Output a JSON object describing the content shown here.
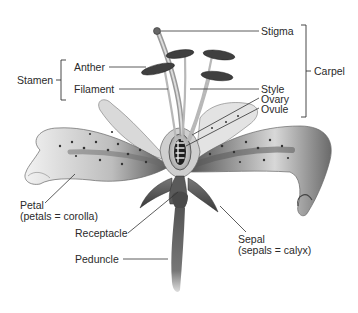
{
  "diagram": {
    "labels": {
      "stigma": "Stigma",
      "carpel": "Carpel",
      "stamen": "Stamen",
      "anther": "Anther",
      "filament": "Filament",
      "style": "Style",
      "ovary": "Ovary",
      "ovule": "Ovule",
      "petal": "Petal",
      "petal_note": "(petals = corolla)",
      "receptacle": "Receptacle",
      "sepal": "Sepal",
      "sepal_note": "(sepals = calyx)",
      "peduncle": "Peduncle"
    },
    "groups": [
      {
        "name": "Stamen",
        "members": [
          "Anther",
          "Filament"
        ]
      },
      {
        "name": "Carpel",
        "members": [
          "Stigma",
          "Style",
          "Ovary",
          "Ovule"
        ]
      }
    ],
    "colors": {
      "ink": "#2a2a2a",
      "leader": "#333333",
      "petal_light": "#e8e8e8",
      "petal_dark": "#555555",
      "background": "#ffffff"
    }
  }
}
